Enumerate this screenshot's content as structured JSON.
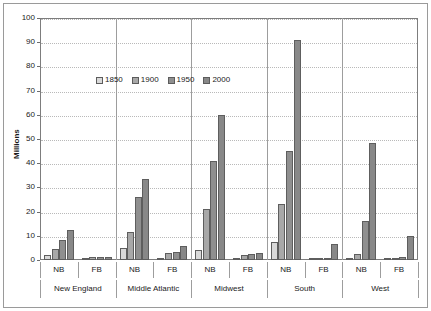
{
  "chart_data": {
    "type": "bar",
    "title": "",
    "xlabel": "",
    "ylabel": "Millions",
    "ylim": [
      0,
      100
    ],
    "ytick_step": 10,
    "yticks": [
      0,
      10,
      20,
      30,
      40,
      50,
      60,
      70,
      80,
      90,
      100
    ],
    "grid": true,
    "legend_position": "top-center-inside",
    "categories": [
      "New England NB",
      "New England FB",
      "Middle Atlantic NB",
      "Middle Atlantic FB",
      "Midwest NB",
      "Midwest FB",
      "South NB",
      "South FB",
      "West NB",
      "West FB"
    ],
    "group_labels": [
      "NB",
      "FB",
      "NB",
      "FB",
      "NB",
      "FB",
      "NB",
      "FB",
      "NB",
      "FB"
    ],
    "regions": [
      "New England",
      "Middle Atlantic",
      "Midwest",
      "South",
      "West"
    ],
    "series": [
      {
        "name": "1850",
        "color": "#d9d9d9",
        "values": [
          2.2,
          0.3,
          5.0,
          1.0,
          4.3,
          0.7,
          7.6,
          0.2,
          0.3,
          0.2
        ]
      },
      {
        "name": "1900",
        "color": "#a8a8a8",
        "values": [
          4.7,
          1.2,
          11.5,
          2.8,
          21.0,
          2.2,
          23.0,
          0.4,
          2.5,
          0.8
        ]
      },
      {
        "name": "1950",
        "color": "#8f8f8f",
        "values": [
          8.1,
          1.1,
          26.0,
          3.4,
          41.0,
          2.6,
          45.0,
          0.5,
          16.0,
          1.2
        ]
      },
      {
        "name": "2000",
        "color": "#888888",
        "values": [
          12.2,
          1.1,
          33.5,
          5.8,
          60.0,
          3.1,
          91.0,
          6.7,
          48.5,
          9.8
        ]
      }
    ]
  },
  "axis": {
    "y_title": "Millions"
  }
}
